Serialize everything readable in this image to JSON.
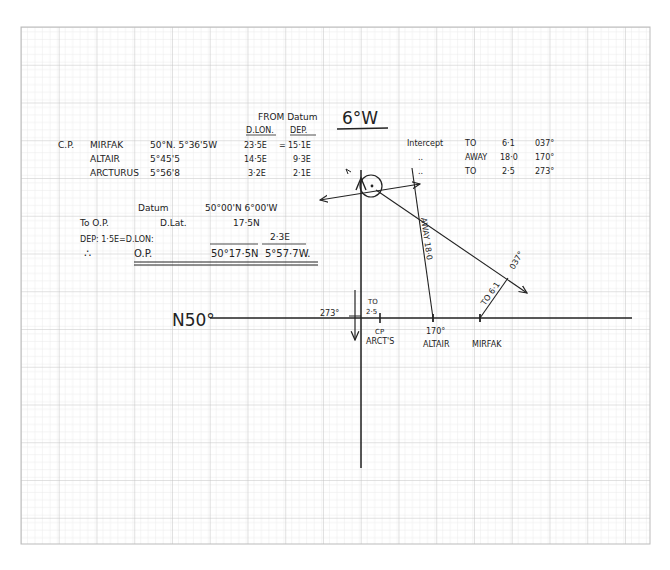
{
  "meridian_label": "6°W",
  "parallel_label": "N50°",
  "from_datum": {
    "title": "FROM Datum",
    "col_dlon": "D.LON.",
    "col_dep": "DEP."
  },
  "cp_prefix": "C.P.",
  "stars": [
    {
      "name": "MIRFAK",
      "cp": "50°N. 5°36'5W",
      "dlon": "23·5E",
      "eq": "=",
      "dep": "15·1E",
      "intercept_label": "Intercept",
      "dir": "TO",
      "dist": "6·1",
      "az": "037°"
    },
    {
      "name": "ALTAIR",
      "cp": "5°45'5",
      "dlon": "14·5E",
      "eq": "",
      "dep": "9·3E",
      "intercept_label": "..",
      "dir": "AWAY",
      "dist": "18·0",
      "az": "170°"
    },
    {
      "name": "ARCTURUS",
      "cp": "5°56'8",
      "dlon": "3·2E",
      "eq": "",
      "dep": "2·1E",
      "intercept_label": "..",
      "dir": "TO",
      "dist": "2·5",
      "az": "273°"
    }
  ],
  "calc": {
    "datum_label": "Datum",
    "datum_value": "50°00'N 6°00'W",
    "to_op": "To O.P.",
    "dlat_label": "D.Lat.",
    "dlat_value": "17·5N",
    "dep_line": "DEP: 1·5E=D.LON:",
    "dlon_value": "2·3E",
    "therefore": "∴",
    "op_label": "O.P.",
    "op_lat": "50°17·5N",
    "op_lon": "5°57·7W."
  },
  "plot_labels": {
    "arct_az": "273°",
    "arct_to": "TO",
    "arct_dist": "2·5",
    "arct_cp": "CP",
    "arct_name": "ARCT'S",
    "altair_az": "170°",
    "altair_name": "ALTAIR",
    "altair_line": "AWAY 18·0",
    "mirfak_name": "MIRFAK",
    "mirfak_line": "TO 6·1",
    "mirfak_az": "037°"
  },
  "colors": {
    "grid_minor": "#e2e2e2",
    "grid_major": "#bdbdbd",
    "ink": "#222222"
  }
}
